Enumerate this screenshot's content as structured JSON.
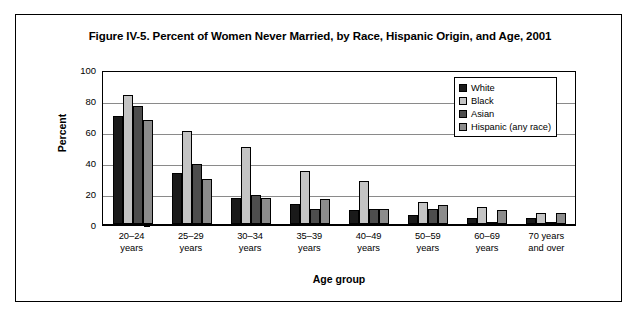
{
  "figure": {
    "title": "Figure IV-5. Percent of Women Never Married, by Race, Hispanic Origin, and Age, 2001"
  },
  "chart_data": {
    "type": "bar",
    "title": "Figure IV-5. Percent of Women Never Married, by Race, Hispanic Origin, and Age, 2001",
    "xlabel": "Age group",
    "ylabel": "Percent",
    "ylim": [
      0,
      100
    ],
    "yticks": [
      0,
      20,
      40,
      60,
      80,
      100
    ],
    "grid": true,
    "legend_position": "top-right inside plot",
    "categories": [
      "20–24 years",
      "25–29 years",
      "30–34 years",
      "35–39 years",
      "40–49 years",
      "50–59 years",
      "60–69 years",
      "70 years and over"
    ],
    "category_lines": [
      [
        "20–24",
        "years"
      ],
      [
        "25–29",
        "years"
      ],
      [
        "30–34",
        "years"
      ],
      [
        "35–39",
        "years"
      ],
      [
        "40–49",
        "years"
      ],
      [
        "50–59",
        "years"
      ],
      [
        "60–69",
        "years"
      ],
      [
        "70 years",
        "and over"
      ]
    ],
    "series": [
      {
        "name": "White",
        "color": "#1a1a1a",
        "values": [
          70,
          33,
          17,
          13,
          9,
          6,
          4,
          4
        ]
      },
      {
        "name": "Black",
        "color": "#c4c4c4",
        "values": [
          83,
          60,
          50,
          34,
          28,
          14,
          11,
          7
        ]
      },
      {
        "name": "Asian",
        "color": "#4d4d4d",
        "values": [
          76,
          39,
          19,
          10,
          10,
          10,
          1,
          1
        ]
      },
      {
        "name": "Hispanic (any race)",
        "color": "#8c8c8c",
        "values": [
          67,
          29,
          17,
          16,
          10,
          12,
          9,
          7
        ]
      }
    ]
  }
}
